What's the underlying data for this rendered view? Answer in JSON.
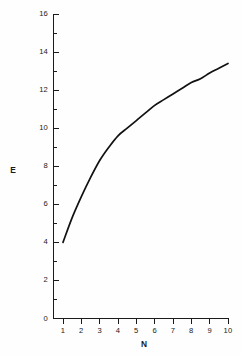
{
  "chart_data": {
    "type": "line",
    "title": "",
    "subtitle": "",
    "xlabel": "N",
    "ylabel": "E",
    "xlim": [
      1,
      10
    ],
    "ylim": [
      0,
      16
    ],
    "grid": false,
    "legend": null,
    "x_ticks": [
      1,
      2,
      3,
      4,
      5,
      6,
      7,
      8,
      9,
      10
    ],
    "x_tick_labels": [
      "1",
      "2",
      "3",
      "4",
      "5",
      "6",
      "7",
      "8",
      "9",
      "10"
    ],
    "x_minor_ticks": [],
    "y_ticks": [
      0,
      2,
      4,
      6,
      8,
      10,
      12,
      14,
      16
    ],
    "y_tick_labels": [
      "0",
      "2",
      "4",
      "6",
      "8",
      "10",
      "12",
      "14",
      "16"
    ],
    "y_minor_ticks": [
      1,
      3,
      5,
      7,
      9,
      11,
      13,
      15
    ],
    "series": [
      {
        "name": "E vs N",
        "color": "#111111",
        "x": [
          1,
          1.5,
          2,
          2.5,
          3,
          3.5,
          4,
          4.5,
          5,
          5.5,
          6,
          6.5,
          7,
          7.5,
          8,
          8.5,
          9,
          9.5,
          10
        ],
        "values": [
          4.0,
          5.3,
          6.4,
          7.4,
          8.3,
          9.0,
          9.6,
          10.0,
          10.4,
          10.8,
          11.2,
          11.5,
          11.8,
          12.1,
          12.4,
          12.6,
          12.9,
          13.15,
          13.4
        ]
      }
    ],
    "annotations": []
  },
  "axes": {
    "y_axis_label": "E",
    "x_axis_label": "N"
  },
  "figure": {
    "background_color": "#fefefe",
    "line_color": "#111111",
    "axis_color": "#1a1a1a"
  }
}
